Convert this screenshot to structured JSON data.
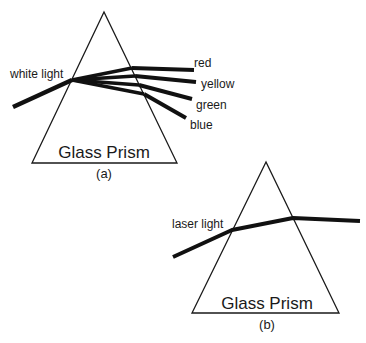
{
  "diagram": {
    "panel_a": {
      "caption": "(a)",
      "prism_label": "Glass Prism",
      "input_label": "white light",
      "prism": {
        "apex": [
          104,
          12
        ],
        "base_left": [
          32,
          163
        ],
        "base_right": [
          177,
          163
        ]
      },
      "incoming_ray": {
        "start": [
          13,
          107
        ],
        "entry": [
          72,
          80
        ]
      },
      "output_rays": [
        {
          "label": "red",
          "exit": [
            132,
            68
          ],
          "end": [
            194,
            70
          ]
        },
        {
          "label": "yellow",
          "exit": [
            135,
            76
          ],
          "end": [
            196,
            82
          ]
        },
        {
          "label": "green",
          "exit": [
            139,
            85
          ],
          "end": [
            192,
            99
          ]
        },
        {
          "label": "blue",
          "exit": [
            144,
            94
          ],
          "end": [
            186,
            118
          ]
        }
      ]
    },
    "panel_b": {
      "caption": "(b)",
      "prism_label": "Glass Prism",
      "input_label": "laser light",
      "prism": {
        "apex": [
          266,
          162
        ],
        "base_left": [
          192,
          313
        ],
        "base_right": [
          339,
          313
        ]
      },
      "ray": {
        "start": [
          173,
          257
        ],
        "entry": [
          232,
          230
        ],
        "exit": [
          293,
          218
        ],
        "end": [
          360,
          221
        ]
      }
    }
  }
}
